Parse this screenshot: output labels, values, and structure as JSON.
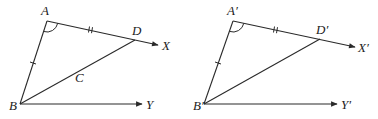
{
  "figures": [
    {
      "id": "left",
      "labels": {
        "A": "A",
        "B": "B",
        "C": "C",
        "D": "D",
        "X": "X",
        "Y": "Y"
      },
      "points": {
        "A": [
          47,
          21
        ],
        "B": [
          20,
          104
        ],
        "D": [
          135,
          40
        ],
        "X_tip": [
          158,
          45
        ],
        "Y_tip": [
          142,
          104
        ]
      },
      "label_pos": {
        "A": [
          41,
          15
        ],
        "B": [
          9,
          110
        ],
        "C": [
          75,
          82
        ],
        "D": [
          132,
          35
        ],
        "X": [
          162,
          50
        ],
        "Y": [
          146,
          109
        ]
      },
      "marks": {
        "AB_single_tick": [
          33,
          63
        ],
        "AD_double_tick": [
          91,
          30
        ],
        "angle_A_arc": true
      }
    },
    {
      "id": "right",
      "labels": {
        "A": "A′",
        "B": "B′",
        "D": "D′",
        "X": "X′",
        "Y": "Y′"
      },
      "points": {
        "A": [
          233,
          21
        ],
        "B": [
          204,
          104
        ],
        "D": [
          320,
          39
        ],
        "X_tip": [
          355,
          47
        ],
        "Y_tip": [
          337,
          104
        ]
      },
      "label_pos": {
        "A": [
          227,
          15
        ],
        "B": [
          193,
          110
        ],
        "D": [
          316,
          34
        ],
        "X": [
          358,
          52
        ],
        "Y": [
          341,
          109
        ]
      },
      "marks": {
        "AB_single_tick": [
          218,
          63
        ],
        "AD_double_tick": [
          276,
          30
        ],
        "angle_A_arc": true
      }
    }
  ],
  "colors": {
    "stroke": "#2a2a2a",
    "label": "#222222",
    "background": "#ffffff"
  }
}
